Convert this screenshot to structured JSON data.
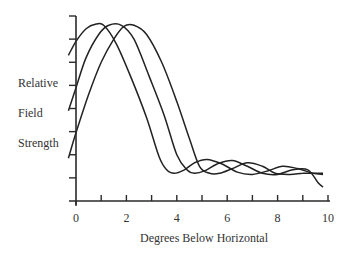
{
  "chart_data": {
    "type": "line",
    "title": "",
    "xlabel": "Degrees Below Horizontal",
    "ylabel_lines": [
      "Relative",
      "Field",
      "Strength"
    ],
    "xlim": [
      0,
      10
    ],
    "ylim": [
      0,
      8
    ],
    "x_ticks": [
      0,
      1,
      2,
      3,
      4,
      5,
      6,
      7,
      8,
      9,
      10
    ],
    "x_tick_labels": [
      {
        "value": 0,
        "label": "0"
      },
      {
        "value": 2,
        "label": "2"
      },
      {
        "value": 4,
        "label": "4"
      },
      {
        "value": 6,
        "label": "6"
      },
      {
        "value": 8,
        "label": "8"
      },
      {
        "value": 10,
        "label": "10"
      }
    ],
    "y_ticks": [
      1,
      2,
      3,
      4,
      5,
      6,
      7,
      8
    ],
    "grid": false,
    "legend": "none",
    "series": [
      {
        "name": "curve-1",
        "points": [
          [
            -0.3,
            6.3
          ],
          [
            0,
            6.9
          ],
          [
            0.4,
            7.45
          ],
          [
            0.8,
            7.65
          ],
          [
            1.1,
            7.6
          ],
          [
            1.6,
            6.8
          ],
          [
            2.2,
            5.3
          ],
          [
            2.8,
            3.6
          ],
          [
            3.3,
            1.9
          ],
          [
            3.6,
            1.35
          ],
          [
            3.9,
            1.2
          ],
          [
            4.3,
            1.35
          ],
          [
            4.7,
            1.65
          ],
          [
            5.2,
            1.8
          ],
          [
            5.8,
            1.6
          ],
          [
            6.4,
            1.25
          ],
          [
            7.0,
            1.15
          ],
          [
            7.6,
            1.3
          ],
          [
            8.2,
            1.5
          ],
          [
            8.8,
            1.4
          ],
          [
            9.4,
            1.2
          ],
          [
            9.8,
            1.15
          ]
        ]
      },
      {
        "name": "curve-2",
        "points": [
          [
            -0.3,
            3.9
          ],
          [
            0,
            4.9
          ],
          [
            0.4,
            6.2
          ],
          [
            0.9,
            7.2
          ],
          [
            1.3,
            7.6
          ],
          [
            1.8,
            7.6
          ],
          [
            2.3,
            7.0
          ],
          [
            2.9,
            5.4
          ],
          [
            3.5,
            3.7
          ],
          [
            4.0,
            2.0
          ],
          [
            4.4,
            1.35
          ],
          [
            4.7,
            1.2
          ],
          [
            5.1,
            1.3
          ],
          [
            5.6,
            1.6
          ],
          [
            6.2,
            1.75
          ],
          [
            6.8,
            1.5
          ],
          [
            7.4,
            1.2
          ],
          [
            8.0,
            1.15
          ],
          [
            8.6,
            1.35
          ],
          [
            9.2,
            1.35
          ],
          [
            9.6,
            0.8
          ],
          [
            9.8,
            0.6
          ]
        ]
      },
      {
        "name": "curve-3",
        "points": [
          [
            -0.3,
            1.85
          ],
          [
            0,
            2.95
          ],
          [
            0.5,
            4.6
          ],
          [
            1.0,
            6.0
          ],
          [
            1.5,
            7.0
          ],
          [
            1.9,
            7.55
          ],
          [
            2.3,
            7.6
          ],
          [
            2.8,
            7.2
          ],
          [
            3.4,
            6.0
          ],
          [
            4.0,
            4.3
          ],
          [
            4.5,
            2.7
          ],
          [
            4.9,
            1.5
          ],
          [
            5.3,
            1.2
          ],
          [
            5.7,
            1.2
          ],
          [
            6.2,
            1.4
          ],
          [
            6.8,
            1.65
          ],
          [
            7.4,
            1.5
          ],
          [
            7.9,
            1.2
          ],
          [
            8.5,
            1.15
          ],
          [
            9.0,
            1.2
          ],
          [
            9.4,
            1.2
          ],
          [
            9.8,
            1.2
          ]
        ]
      }
    ]
  }
}
